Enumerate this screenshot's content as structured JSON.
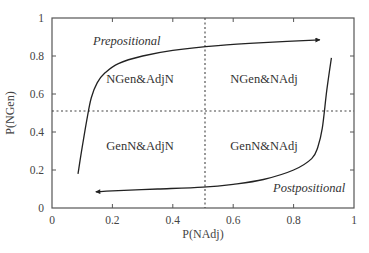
{
  "chart_data": {
    "type": "line",
    "title": "",
    "xlabel": "P(NAdj)",
    "ylabel": "P(NGen)",
    "xlim": [
      0,
      1
    ],
    "ylim": [
      0,
      1
    ],
    "grid": false,
    "legend": null,
    "x_ticks": [
      0,
      0.2,
      0.4,
      0.6,
      0.8,
      1
    ],
    "x_tick_labels": [
      "0",
      "0.2",
      "0.4",
      "0.6",
      "0.8",
      "1"
    ],
    "y_ticks": [
      0,
      0.2,
      0.4,
      0.6,
      0.8,
      1
    ],
    "y_tick_labels": [
      "0",
      "0.2",
      "0.4",
      "0.6",
      "0.8",
      "1"
    ],
    "reference_lines": [
      {
        "orientation": "vertical",
        "value": 0.5,
        "style": "dotted"
      },
      {
        "orientation": "horizontal",
        "value": 0.51,
        "style": "dotted"
      }
    ],
    "quadrant_labels": [
      {
        "text": "NGen&AdjN",
        "x": 0.29,
        "y": 0.68
      },
      {
        "text": "NGen&NAdj",
        "x": 0.7,
        "y": 0.68
      },
      {
        "text": "GenN&AdjN",
        "x": 0.29,
        "y": 0.33
      },
      {
        "text": "GenN&NAdj",
        "x": 0.7,
        "y": 0.33
      }
    ],
    "series": [
      {
        "name": "Prepositional",
        "arrow": "end",
        "label_position": {
          "x": 0.22,
          "y": 0.88
        },
        "points": [
          [
            0.086,
            0.18
          ],
          [
            0.1,
            0.32
          ],
          [
            0.115,
            0.46
          ],
          [
            0.13,
            0.58
          ],
          [
            0.15,
            0.66
          ],
          [
            0.175,
            0.71
          ],
          [
            0.22,
            0.76
          ],
          [
            0.3,
            0.8
          ],
          [
            0.4,
            0.83
          ],
          [
            0.55,
            0.855
          ],
          [
            0.7,
            0.87
          ],
          [
            0.887,
            0.885
          ]
        ]
      },
      {
        "name": "Postpositional",
        "arrow": "end",
        "label_position": {
          "x": 0.83,
          "y": 0.11
        },
        "points": [
          [
            0.925,
            0.79
          ],
          [
            0.91,
            0.62
          ],
          [
            0.895,
            0.42
          ],
          [
            0.88,
            0.32
          ],
          [
            0.86,
            0.26
          ],
          [
            0.8,
            0.2
          ],
          [
            0.7,
            0.15
          ],
          [
            0.6,
            0.125
          ],
          [
            0.5,
            0.11
          ],
          [
            0.35,
            0.1
          ],
          [
            0.2,
            0.09
          ],
          [
            0.145,
            0.085
          ]
        ]
      }
    ]
  },
  "labels": {
    "xlabel": "P(NAdj)",
    "ylabel": "P(NGen)",
    "x_ticks": [
      "0",
      "0.2",
      "0.4",
      "0.6",
      "0.8",
      "1"
    ],
    "y_ticks": [
      "0",
      "0.2",
      "0.4",
      "0.6",
      "0.8",
      "1"
    ],
    "quadrants": {
      "top_left": "NGen&AdjN",
      "top_right": "NGen&NAdj",
      "bottom_left": "GenN&AdjN",
      "bottom_right": "GenN&NAdj"
    },
    "curves": {
      "upper": "Prepositional",
      "lower": "Postpositional"
    }
  },
  "colors": {
    "axis": "#555555",
    "curve": "#222222",
    "reference_line": "#444444",
    "text": "#333333"
  }
}
